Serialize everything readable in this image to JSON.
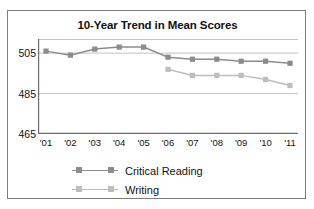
{
  "chart_data": {
    "type": "line",
    "title": "10-Year Trend in Mean Scores",
    "xlabel": "",
    "ylabel": "",
    "categories": [
      "'01",
      "'02",
      "'03",
      "'04",
      "'05",
      "'06",
      "'07",
      "'08",
      "'09",
      "'10",
      "'11"
    ],
    "ylim": [
      465,
      512
    ],
    "yticks": [
      465,
      485,
      505
    ],
    "grid": true,
    "legend_position": "bottom",
    "series": [
      {
        "name": "Critical Reading",
        "color": "#8c8c8c",
        "values": [
          506,
          504,
          507,
          508,
          508,
          503,
          502,
          502,
          501,
          501,
          500
        ]
      },
      {
        "name": "Writing",
        "color": "#bdbdbd",
        "values": [
          null,
          null,
          null,
          null,
          null,
          497,
          494,
          494,
          494,
          492,
          489
        ]
      }
    ]
  },
  "legend": {
    "items": [
      {
        "label": "Critical Reading"
      },
      {
        "label": "Writing"
      }
    ]
  },
  "colors": {
    "critical_reading": "#8c8c8c",
    "writing": "#bdbdbd",
    "axis": "#6e6e6e",
    "grid": "#b5b5b5",
    "border": "#7c7c7c",
    "text": "#111111"
  }
}
